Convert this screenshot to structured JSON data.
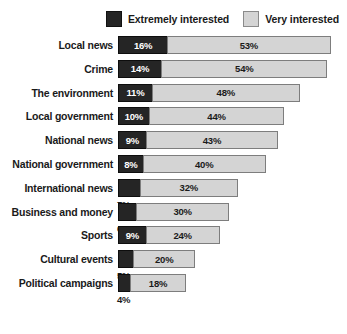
{
  "legend": {
    "entries": [
      {
        "label": "Extremely interested",
        "swatch": "dark-square-icon",
        "color": "#252525"
      },
      {
        "label": "Very interested",
        "swatch": "light-square-icon",
        "color": "#d4d4d4"
      }
    ]
  },
  "chart_data": {
    "type": "bar",
    "title": "",
    "subtitle": "",
    "xlabel": "",
    "ylabel": "",
    "orientation": "horizontal",
    "stacked": true,
    "grid": false,
    "legend_position": "top-right",
    "xlim": [
      0,
      75
    ],
    "value_suffix": "%",
    "categories": [
      "Local news",
      "Crime",
      "The environment",
      "Local government",
      "National news",
      "National government",
      "International news",
      "Business and money",
      "Sports",
      "Cultural events",
      "Political campaigns"
    ],
    "series": [
      {
        "name": "Extremely interested",
        "color": "#252525",
        "values": [
          16,
          14,
          11,
          10,
          9,
          8,
          7,
          6,
          9,
          5,
          4
        ],
        "labels": [
          "16%",
          "14%",
          "11%",
          "10%",
          "9%",
          "8%",
          "7%",
          "6%",
          "9%",
          "5%",
          "4%"
        ],
        "label_placement": [
          "inside",
          "inside",
          "inside",
          "inside",
          "inside",
          "inside",
          "inside",
          "inside",
          "inside",
          "inside",
          "below"
        ]
      },
      {
        "name": "Very interested",
        "color": "#d4d4d4",
        "values": [
          53,
          54,
          48,
          44,
          43,
          40,
          32,
          30,
          24,
          20,
          18
        ],
        "labels": [
          "53%",
          "54%",
          "48%",
          "44%",
          "43%",
          "40%",
          "32%",
          "30%",
          "24%",
          "20%",
          "18%"
        ],
        "label_placement": [
          "inside",
          "inside",
          "inside",
          "inside",
          "inside",
          "inside",
          "inside",
          "inside",
          "inside",
          "inside",
          "inside"
        ]
      }
    ],
    "totals": [
      69,
      68,
      59,
      54,
      52,
      48,
      39,
      36,
      33,
      25,
      22
    ]
  }
}
